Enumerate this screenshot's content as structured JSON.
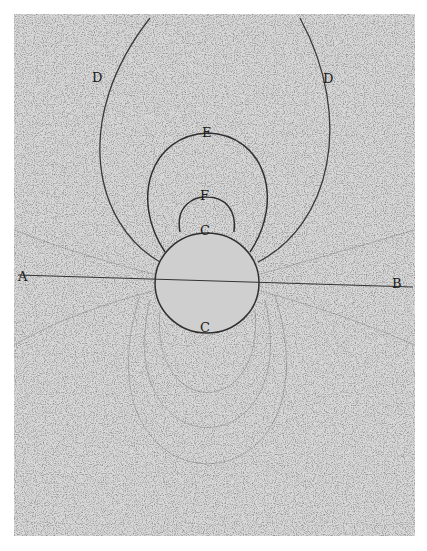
{
  "figure": {
    "type": "iron-filings magnetic field engraving",
    "plate_color": "#d9d9d9",
    "ink_color": "#2a2a2a",
    "labels": {
      "A": "A",
      "B": "B",
      "C_top": "C",
      "C_bottom": "C",
      "D_left": "D",
      "D_right": "D",
      "E": "E",
      "F": "F"
    }
  }
}
